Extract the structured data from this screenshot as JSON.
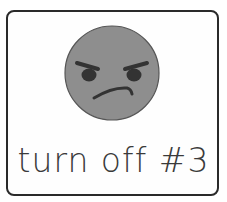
{
  "card": {
    "label": "turn off #3",
    "icon": "angry-face-icon"
  },
  "colors": {
    "border": "#2a2a2a",
    "face_fill": "#8e8e8e",
    "features": "#333333",
    "text": "#3a3a3a"
  }
}
